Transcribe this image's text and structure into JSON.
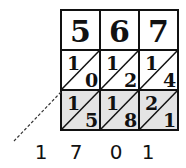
{
  "diagram": {
    "type": "lattice-multiplication",
    "multiplicand_digits": [
      "5",
      "6",
      "7"
    ],
    "multiplier_digits": [
      "2",
      "3"
    ],
    "rows": [
      {
        "shaded": false,
        "cells": [
          {
            "tens": "1",
            "ones": "0"
          },
          {
            "tens": "1",
            "ones": "2"
          },
          {
            "tens": "1",
            "ones": "4"
          }
        ]
      },
      {
        "shaded": true,
        "cells": [
          {
            "tens": "1",
            "ones": "5"
          },
          {
            "tens": "1",
            "ones": "8"
          },
          {
            "tens": "2",
            "ones": "1"
          }
        ]
      }
    ],
    "result_digits": [
      "1",
      "7",
      "0",
      "1"
    ],
    "colors": {
      "line": "#111111",
      "shade": "#e4e4e4",
      "background": "#ffffff"
    }
  }
}
